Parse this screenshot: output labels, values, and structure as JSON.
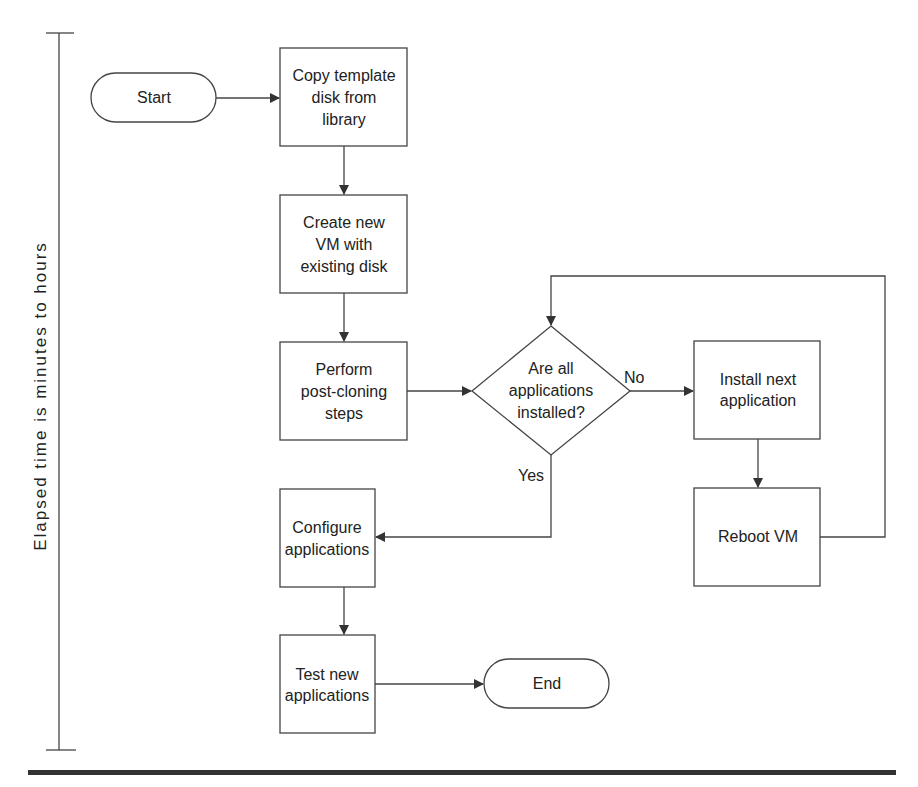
{
  "timeline": {
    "label": "Elapsed time is minutes to hours"
  },
  "nodes": {
    "start": {
      "type": "terminator",
      "label": "Start"
    },
    "copy_template": {
      "type": "process",
      "lines": [
        "Copy template",
        "disk from",
        "library"
      ]
    },
    "create_vm": {
      "type": "process",
      "lines": [
        "Create new",
        "VM with",
        "existing disk"
      ]
    },
    "post_cloning": {
      "type": "process",
      "lines": [
        "Perform",
        "post-cloning",
        "steps"
      ]
    },
    "decision": {
      "type": "decision",
      "lines": [
        "Are all",
        "applications",
        "installed?"
      ]
    },
    "install_next": {
      "type": "process",
      "lines": [
        "Install next",
        "application"
      ]
    },
    "reboot": {
      "type": "process",
      "label": "Reboot VM"
    },
    "configure": {
      "type": "process",
      "lines": [
        "Configure",
        "applications"
      ]
    },
    "test": {
      "type": "process",
      "lines": [
        "Test new",
        "applications"
      ]
    },
    "end": {
      "type": "terminator",
      "label": "End"
    }
  },
  "edges": {
    "no_label": "No",
    "yes_label": "Yes"
  },
  "colors": {
    "stroke": "#444444",
    "text": "#222222",
    "rule": "#333333"
  }
}
